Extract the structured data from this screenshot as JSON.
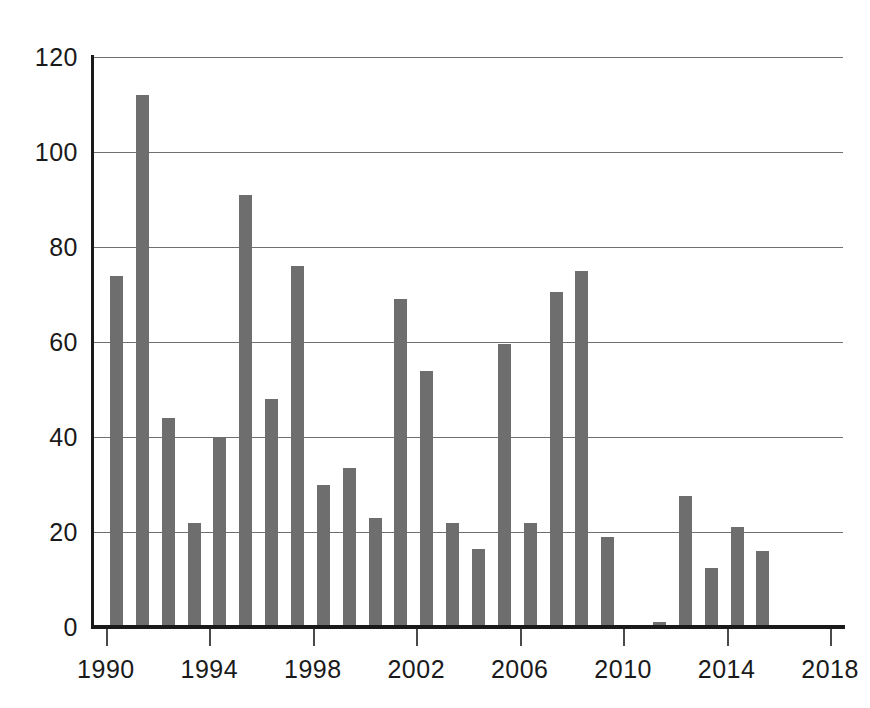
{
  "chart_data": {
    "type": "bar",
    "title": "",
    "subtitle": "",
    "xlabel": "",
    "ylabel": "",
    "categories": [
      "1990",
      "1991",
      "1992",
      "1993",
      "1994",
      "1995",
      "1996",
      "1997",
      "1998",
      "1999",
      "2000",
      "2001",
      "2002",
      "2003",
      "2004",
      "2005",
      "2006",
      "2007",
      "2008",
      "2009",
      "2010",
      "2011",
      "2012",
      "2013",
      "2014",
      "2015"
    ],
    "values": [
      74,
      112,
      44,
      22,
      40,
      91,
      48,
      76,
      30,
      33.5,
      23,
      69,
      54,
      22,
      16.5,
      59.5,
      22,
      70.5,
      75,
      19,
      0.3,
      1,
      27.5,
      12.5,
      21,
      16
    ],
    "x": [
      1990,
      1991,
      1992,
      1993,
      1994,
      1995,
      1996,
      1997,
      1998,
      1999,
      2000,
      2001,
      2002,
      2003,
      2004,
      2005,
      2006,
      2007,
      2008,
      2009,
      2010,
      2011,
      2012,
      2013,
      2014,
      2015
    ],
    "ylim": [
      0,
      120
    ],
    "xlim": [
      1989.5,
      2018.5
    ],
    "y_ticks": [
      0,
      20,
      40,
      60,
      80,
      100,
      120
    ],
    "y_tick_labels": [
      "0",
      "20",
      "40",
      "60",
      "80",
      "100",
      "120"
    ],
    "x_ticks": [
      1990,
      1994,
      1998,
      2002,
      2006,
      2010,
      2014,
      2018
    ],
    "x_tick_labels": [
      "1990",
      "1994",
      "1998",
      "2002",
      "2006",
      "2010",
      "2014",
      "2018"
    ],
    "grid": true,
    "grid_axis": "y",
    "legend": null,
    "legend_position": "none",
    "annotations": [],
    "colors": {
      "bar_fill": "#6e6e6e",
      "gridline": "#6f6f6f",
      "axis_line": "#1a1a1a",
      "tick_label": "#1a1a1a",
      "background": "#ffffff"
    }
  }
}
